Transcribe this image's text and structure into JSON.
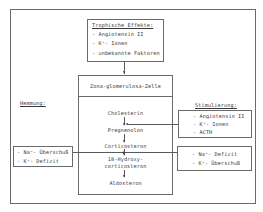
{
  "trophic": {
    "title": "Trophische Effekte:",
    "items": [
      "- Angiotensin II",
      "- K⁺- Ionen",
      "- unbekannte Faktoren"
    ]
  },
  "cell": {
    "title": "Zona-glomerulosa-Zelle",
    "pathway": [
      "Cholesterin",
      "Pregnenolon",
      "Corticosteron",
      "18-Hydroxy-",
      "corticosteron",
      "Aldosteron"
    ]
  },
  "inhibition": {
    "label": "Hemmung:",
    "items": [
      "- Na⁺- Überschuß",
      "- K⁺- Defizit"
    ]
  },
  "stimulation": {
    "label": "Stimulierung:",
    "box1": [
      "- Angiotensin II",
      "- K⁺- Ionen",
      "- ACTH"
    ],
    "box2": [
      "- Na⁺- Defizit",
      "- K⁺- Überschuß"
    ]
  }
}
